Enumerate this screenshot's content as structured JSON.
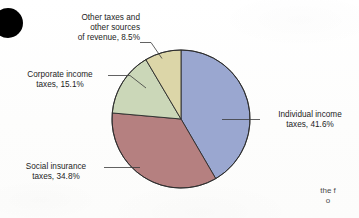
{
  "figure": {
    "background_color": "#fefefe",
    "corner_mark": {
      "name": "black-dot",
      "color": "#000000"
    },
    "cropped_note": {
      "line1": "the f",
      "line2": "o"
    }
  },
  "chart_data": {
    "type": "pie",
    "title": "",
    "subtitle": "",
    "xlabel": "",
    "ylabel": "",
    "legend_position": "callout-labels",
    "grid": false,
    "start_angle_deg": 0,
    "direction": "clockwise",
    "categories": [
      "Individual income taxes",
      "Social insurance taxes",
      "Corporate income taxes",
      "Other taxes and other sources of revenue"
    ],
    "values": [
      41.6,
      34.8,
      15.1,
      8.5
    ],
    "value_unit": "%",
    "colors": [
      "#9aa7d0",
      "#b58080",
      "#cbd7b8",
      "#dcd6a8"
    ],
    "slices": [
      {
        "key": "individual",
        "label": "Individual income taxes",
        "value": 41.6,
        "value_text": "41.6%",
        "color": "#9aa7d0",
        "callout_lines": [
          "Individual income",
          "taxes, 41.6%"
        ]
      },
      {
        "key": "social",
        "label": "Social insurance taxes",
        "value": 34.8,
        "value_text": "34.8%",
        "color": "#b58080",
        "callout_lines": [
          "Social insurance",
          "taxes, 34.8%"
        ]
      },
      {
        "key": "corporate",
        "label": "Corporate income taxes",
        "value": 15.1,
        "value_text": "15.1%",
        "color": "#cbd7b8",
        "callout_lines": [
          "Corporate income",
          "taxes, 15.1%"
        ]
      },
      {
        "key": "other",
        "label": "Other taxes and other sources of revenue",
        "value": 8.5,
        "value_text": "8.5%",
        "color": "#dcd6a8",
        "callout_lines": [
          "Other taxes and",
          "other sources",
          "of revenue, 8.5%"
        ]
      }
    ]
  },
  "labels": {
    "other": {
      "line1": "Other taxes and",
      "line2": "other sources",
      "line3": "of revenue, 8.5%"
    },
    "corporate": {
      "line1": "Corporate income",
      "line2": "taxes, 15.1%"
    },
    "social": {
      "line1": "Social insurance",
      "line2": "taxes, 34.8%"
    },
    "individual": {
      "line1": "Individual income",
      "line2": "taxes, 41.6%"
    }
  }
}
